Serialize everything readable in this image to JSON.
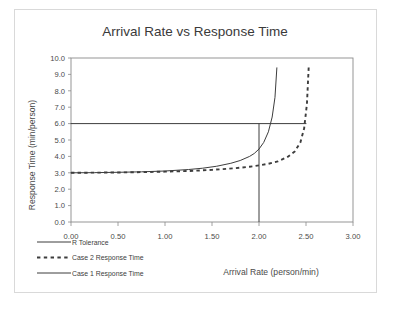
{
  "chart_data": {
    "type": "line",
    "title": "Arrival Rate vs Response Time",
    "xlabel": "Arrival Rate (person/min)",
    "ylabel": "Response Time (min/person)",
    "xlim": [
      0.0,
      3.0
    ],
    "ylim": [
      0.0,
      10.0
    ],
    "xticks": [
      "0.00",
      "0.50",
      "1.00",
      "1.50",
      "2.00",
      "2.50",
      "3.00"
    ],
    "xtick_values": [
      0.0,
      0.5,
      1.0,
      1.5,
      2.0,
      2.5,
      3.0
    ],
    "yticks": [
      "0.0",
      "1.0",
      "2.0",
      "3.0",
      "4.0",
      "5.0",
      "6.0",
      "7.0",
      "8.0",
      "9.0",
      "10.0"
    ],
    "ytick_values": [
      0,
      1,
      2,
      3,
      4,
      5,
      6,
      7,
      8,
      9,
      10
    ],
    "grid": false,
    "legend_position": "bottom-left",
    "series": [
      {
        "name": "R Tolerance",
        "style": "solid",
        "color": "#3d3d3d",
        "description": "Horizontal tolerance threshold at 6.0 min/person",
        "value": 6.0,
        "x": [
          0.0,
          2.5
        ],
        "y": [
          6.0,
          6.0
        ]
      },
      {
        "name": "Case 2 Response Time",
        "style": "dashed",
        "color": "#3d3d3d",
        "description": "Service capacity 2.55 person/min; service time 3.0 min/person",
        "asymptote": 2.55,
        "base_value": 3.0,
        "x": [
          0.0,
          0.25,
          0.5,
          0.75,
          1.0,
          1.25,
          1.5,
          1.75,
          1.9,
          2.0,
          2.1,
          2.2,
          2.3,
          2.38,
          2.44,
          2.48,
          2.51,
          2.53
        ],
        "y": [
          3.0,
          3.01,
          3.02,
          3.04,
          3.07,
          3.11,
          3.18,
          3.28,
          3.37,
          3.45,
          3.55,
          3.7,
          3.95,
          4.3,
          4.85,
          5.7,
          7.2,
          9.6
        ]
      },
      {
        "name": "Case 1 Response Time",
        "style": "solid",
        "color": "#3d3d3d",
        "description": "Service capacity 2.22 person/min; service time 3.0 min/person; vertical marker drawn at 2.00",
        "asymptote": 2.22,
        "base_value": 3.0,
        "marker_x": 2.0,
        "x": [
          0.0,
          0.25,
          0.5,
          0.75,
          1.0,
          1.25,
          1.4,
          1.55,
          1.7,
          1.8,
          1.9,
          1.95,
          2.0,
          2.05,
          2.1,
          2.14,
          2.17,
          2.19
        ],
        "y": [
          3.0,
          3.01,
          3.03,
          3.06,
          3.11,
          3.2,
          3.28,
          3.4,
          3.58,
          3.75,
          4.0,
          4.18,
          4.45,
          4.85,
          5.5,
          6.4,
          7.6,
          9.4
        ]
      }
    ],
    "annotations": [
      {
        "name": "operating-point-marker",
        "description": "Vertical line at arrival rate 2.00 from axis up to R Tolerance level 6.0",
        "x": 2.0,
        "y_from": 0.0,
        "y_to": 6.0
      }
    ]
  },
  "legend": {
    "items": [
      {
        "label": "R Tolerance",
        "style": "solid"
      },
      {
        "label": "Case 2 Response Time",
        "style": "dashed"
      },
      {
        "label": "Case 1 Response Time",
        "style": "solid"
      }
    ]
  }
}
